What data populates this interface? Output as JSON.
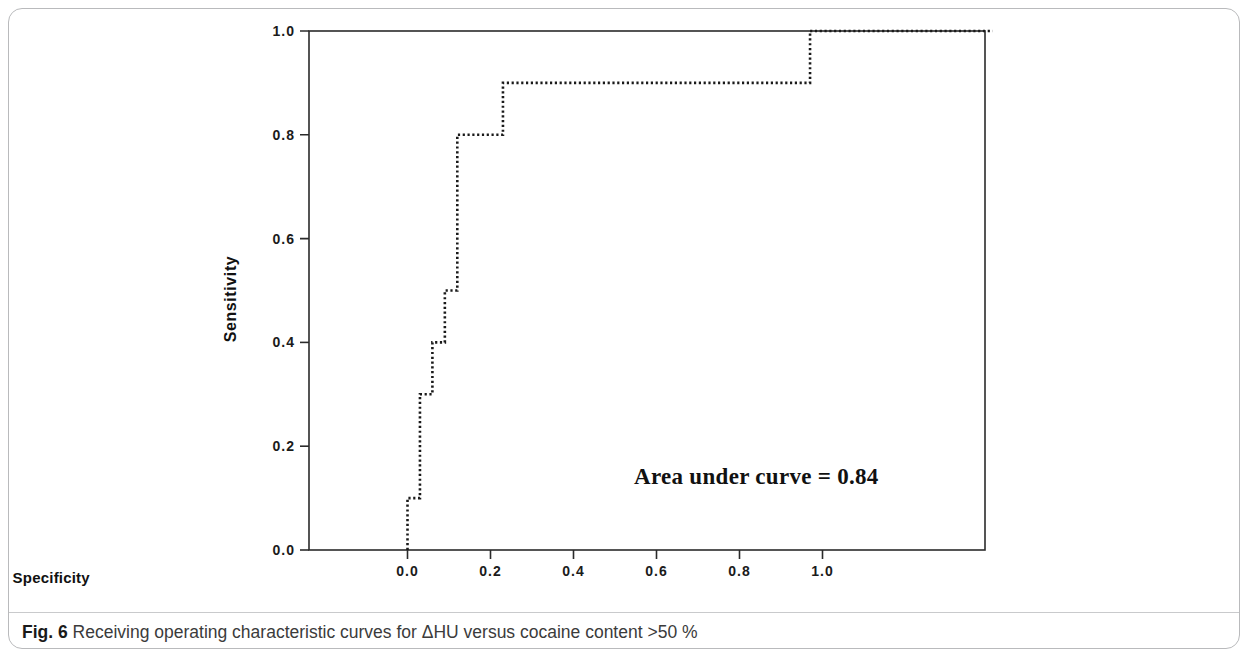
{
  "figure": {
    "caption_label": "Fig. 6",
    "caption_text": " Receiving operating characteristic curves for ΔHU versus cocaine content >50 %"
  },
  "chart_data": {
    "type": "line",
    "title": "",
    "xlabel": "1 - Specificity",
    "ylabel": "Sensitivity",
    "xlim": [
      -0.22,
      1.41
    ],
    "ylim": [
      0.0,
      1.0
    ],
    "xticks": [
      "0.0",
      "0.2",
      "0.4",
      "0.6",
      "0.8",
      "1.0"
    ],
    "xtick_values": [
      0.0,
      0.2,
      0.4,
      0.6,
      0.8,
      1.0
    ],
    "yticks": [
      "0.0",
      "0.2",
      "0.4",
      "0.6",
      "0.8",
      "1.0"
    ],
    "ytick_values": [
      0.0,
      0.2,
      0.4,
      0.6,
      0.8,
      1.0
    ],
    "grid": false,
    "legend": null,
    "linestyle": "dotted",
    "line_color": "#1a1a1a",
    "frame_color": "#2b2b2b",
    "series": [
      {
        "name": "ROC curve (ΔHU vs cocaine content >50 %)",
        "x": [
          0.0,
          0.0,
          0.03,
          0.03,
          0.06,
          0.06,
          0.09,
          0.09,
          0.12,
          0.12,
          0.23,
          0.23,
          0.97,
          0.97,
          1.41
        ],
        "y": [
          0.0,
          0.1,
          0.1,
          0.3,
          0.3,
          0.4,
          0.4,
          0.5,
          0.5,
          0.8,
          0.8,
          0.9,
          0.9,
          1.0,
          1.0
        ]
      }
    ],
    "annotations": [
      {
        "name": "area-under-curve",
        "text": "Area under curve = 0.84",
        "value": 0.84,
        "x": 0.62,
        "y": 0.17
      }
    ]
  }
}
